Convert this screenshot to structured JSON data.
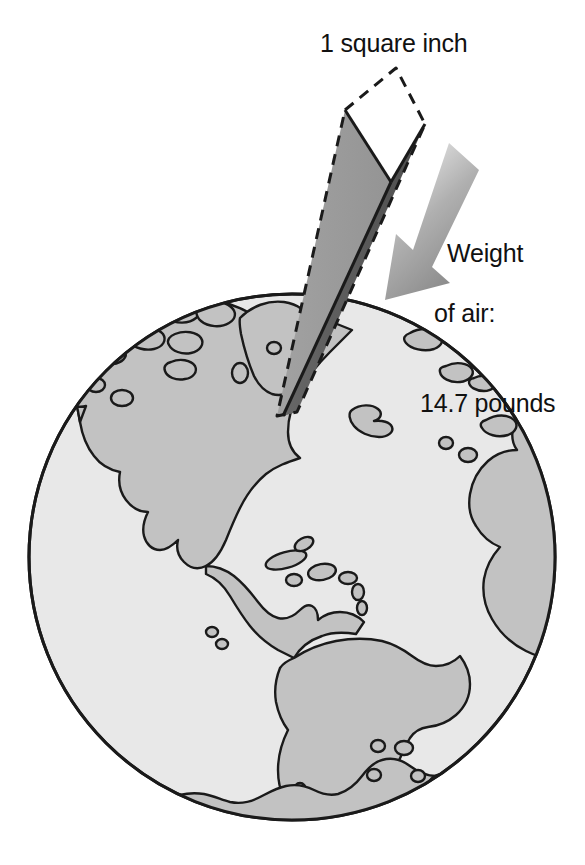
{
  "figure": {
    "background_color": "#ffffff"
  },
  "labels": {
    "column_top": "1 square inch",
    "arrow_line1": "Weight",
    "arrow_line2": "of air:",
    "arrow_line3": "14.7 pounds"
  },
  "measurements": {
    "area": "1 square inch",
    "weight_value": "14.7",
    "weight_unit": "pounds"
  },
  "colors": {
    "outline": "#1a1a1a",
    "ocean": "#e8e8e8",
    "land": "#c2c2c2",
    "column_light_face": "#9a9a9a",
    "column_dark_face": "#5f5f5f",
    "column_top_face": "#ffffff",
    "arrow_light": "#dddddd",
    "arrow_dark": "#8e8e8e",
    "text": "#111111"
  },
  "geometry": {
    "globe_center_x": 292,
    "globe_center_y": 557,
    "globe_radius": 264,
    "column_tip_x": 277,
    "column_tip_y": 416,
    "column_top_apex_x": 396,
    "column_top_apex_y": 68
  },
  "elements": {
    "globe_name": "earth-globe",
    "column_name": "air-column-prism",
    "arrow_name": "weight-arrow",
    "landmasses": [
      "North America",
      "South America",
      "Greenland",
      "Arctic islands",
      "Caribbean islands",
      "Western Europe",
      "Africa",
      "Antarctica"
    ]
  }
}
